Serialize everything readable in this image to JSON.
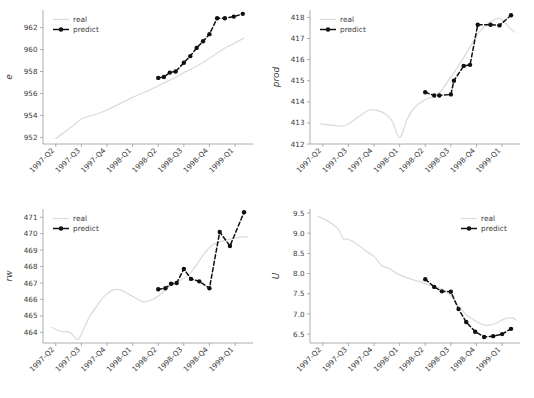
{
  "figure": {
    "background": "#ffffff",
    "layout": "2x2 grid of line charts",
    "panel_order": [
      "e",
      "prod",
      "rw",
      "U"
    ]
  },
  "style": {
    "real_color": "#dcdcdc",
    "predict_color": "#101010",
    "axis_color": "#9a9a9a",
    "text_color": "#3a3a3a"
  },
  "legend": {
    "real_label": "real",
    "predict_label": "predict"
  },
  "x_categories": [
    "1997-Q2",
    "1997-Q3",
    "1997-Q4",
    "1998-Q1",
    "1998-Q2",
    "1998-Q3",
    "1998-Q4",
    "1999-Q1"
  ],
  "chart_data": [
    {
      "type": "line",
      "title": "",
      "xlabel": "",
      "ylabel": "e",
      "grid": false,
      "legend_position": "upper left",
      "xlim": [
        0,
        8.2
      ],
      "ylim": [
        951.4,
        963.6
      ],
      "yticks": [
        952,
        954,
        956,
        958,
        960,
        962
      ],
      "xticks": [
        0.5,
        1.5,
        2.5,
        3.5,
        4.5,
        5.5,
        6.5,
        7.5
      ],
      "xticklabels": [
        "1997-Q2",
        "1997-Q3",
        "1997-Q4",
        "1998-Q1",
        "1998-Q2",
        "1998-Q3",
        "1998-Q4",
        "1999-Q1"
      ],
      "series": [
        {
          "name": "real",
          "x": [
            0.5,
            0.85,
            1.2,
            1.5,
            1.85,
            2.2,
            2.5,
            2.85,
            3.2,
            3.5,
            3.85,
            4.2,
            4.5,
            4.85,
            5.2,
            5.5,
            5.85,
            6.2,
            6.5,
            6.85,
            7.2,
            7.5,
            7.85
          ],
          "values": [
            951.9,
            952.5,
            953.1,
            953.7,
            953.95,
            954.2,
            954.5,
            954.9,
            955.3,
            955.65,
            956.0,
            956.35,
            956.7,
            957.1,
            957.5,
            957.9,
            958.3,
            958.75,
            959.2,
            959.75,
            960.25,
            960.6,
            961.05
          ]
        },
        {
          "name": "predict",
          "x": [
            4.5,
            4.72,
            4.95,
            5.18,
            5.5,
            5.75,
            6.0,
            6.25,
            6.5,
            6.8,
            7.1,
            7.45,
            7.8
          ],
          "values": [
            957.42,
            957.5,
            957.9,
            958.0,
            958.8,
            959.4,
            960.15,
            960.75,
            961.4,
            962.85,
            962.85,
            963.0,
            963.25
          ]
        }
      ]
    },
    {
      "type": "line",
      "title": "",
      "xlabel": "",
      "ylabel": "prod",
      "grid": false,
      "legend_position": "upper left",
      "xlim": [
        0,
        8.2
      ],
      "ylim": [
        412.0,
        418.35
      ],
      "yticks": [
        412,
        413,
        414,
        415,
        416,
        417,
        418
      ],
      "xticks": [
        0.5,
        1.5,
        2.5,
        3.5,
        4.5,
        5.5,
        6.5,
        7.5
      ],
      "xticklabels": [
        "1997-Q2",
        "1997-Q3",
        "1997-Q4",
        "1998-Q1",
        "1998-Q2",
        "1998-Q3",
        "1998-Q4",
        "1999-Q1"
      ],
      "series": [
        {
          "name": "real",
          "x": [
            0.4,
            0.8,
            1.2,
            1.5,
            1.9,
            2.3,
            2.6,
            2.9,
            3.2,
            3.5,
            3.8,
            4.1,
            4.5,
            4.8,
            5.1,
            5.4,
            5.8,
            6.2,
            6.6,
            7.0,
            7.4,
            7.8,
            8.0
          ],
          "values": [
            412.95,
            412.9,
            412.85,
            412.95,
            413.3,
            413.6,
            413.6,
            413.45,
            413.1,
            412.3,
            413.2,
            413.75,
            414.1,
            414.25,
            414.5,
            415.0,
            415.7,
            416.5,
            417.3,
            417.75,
            417.95,
            417.5,
            417.3
          ]
        },
        {
          "name": "predict",
          "x": [
            4.5,
            4.85,
            5.05,
            5.5,
            5.62,
            6.0,
            6.25,
            6.55,
            7.05,
            7.4,
            7.85
          ],
          "values": [
            414.45,
            414.3,
            414.3,
            414.35,
            415.0,
            415.7,
            415.75,
            417.65,
            417.65,
            417.62,
            418.1
          ]
        }
      ]
    },
    {
      "type": "line",
      "title": "",
      "xlabel": "",
      "ylabel": "rw",
      "grid": false,
      "legend_position": "upper left",
      "xlim": [
        0,
        8.2
      ],
      "ylim": [
        463.35,
        471.5
      ],
      "yticks": [
        464,
        465,
        466,
        467,
        468,
        469,
        470,
        471
      ],
      "xticks": [
        0.5,
        1.5,
        2.5,
        3.5,
        4.5,
        5.5,
        6.5,
        7.5
      ],
      "xticklabels": [
        "1997-Q2",
        "1997-Q3",
        "1997-Q4",
        "1998-Q1",
        "1998-Q2",
        "1998-Q3",
        "1998-Q4",
        "1999-Q1"
      ],
      "series": [
        {
          "name": "real",
          "x": [
            0.35,
            0.7,
            1.05,
            1.35,
            1.5,
            1.8,
            2.1,
            2.4,
            2.7,
            3.0,
            3.3,
            3.6,
            3.9,
            4.2,
            4.5,
            4.8,
            5.1,
            5.4,
            5.7,
            6.0,
            6.3,
            6.6,
            7.0,
            7.4,
            7.8,
            8.0
          ],
          "values": [
            464.3,
            464.05,
            464.0,
            463.55,
            463.9,
            464.9,
            465.6,
            466.2,
            466.55,
            466.6,
            466.35,
            466.1,
            465.85,
            465.95,
            466.2,
            466.6,
            466.9,
            467.2,
            467.5,
            468.1,
            468.8,
            469.3,
            469.55,
            469.7,
            469.8,
            469.8
          ]
        },
        {
          "name": "predict",
          "x": [
            4.5,
            4.78,
            5.0,
            5.22,
            5.5,
            5.78,
            6.1,
            6.5,
            6.9,
            7.3,
            7.85
          ],
          "values": [
            466.62,
            466.68,
            466.95,
            467.0,
            467.85,
            467.25,
            467.1,
            466.68,
            470.1,
            469.25,
            471.3
          ]
        }
      ]
    },
    {
      "type": "line",
      "title": "",
      "xlabel": "",
      "ylabel": "U",
      "grid": false,
      "legend_position": "upper right",
      "xlim": [
        0,
        8.2
      ],
      "ylim": [
        6.28,
        9.6
      ],
      "yticks": [
        6.5,
        7.0,
        7.5,
        8.0,
        8.5,
        9.0,
        9.5
      ],
      "yticklabels": [
        "6.5",
        "7.0",
        "7.5",
        "8.0",
        "8.5",
        "9.0",
        "9.5"
      ],
      "xticks": [
        0.5,
        1.5,
        2.5,
        3.5,
        4.5,
        5.5,
        6.5,
        7.5
      ],
      "xticklabels": [
        "1997-Q2",
        "1997-Q3",
        "1997-Q4",
        "1998-Q1",
        "1998-Q2",
        "1998-Q3",
        "1998-Q4",
        "1999-Q1"
      ],
      "series": [
        {
          "name": "real",
          "x": [
            0.3,
            0.7,
            1.1,
            1.3,
            1.5,
            1.9,
            2.2,
            2.5,
            2.8,
            3.1,
            3.4,
            3.7,
            4.0,
            4.3,
            4.6,
            4.9,
            5.2,
            5.5,
            5.8,
            6.1,
            6.4,
            6.7,
            7.0,
            7.3,
            7.6,
            7.9,
            8.05
          ],
          "values": [
            9.42,
            9.3,
            9.1,
            8.87,
            8.85,
            8.7,
            8.55,
            8.42,
            8.2,
            8.12,
            8.0,
            7.92,
            7.85,
            7.8,
            7.72,
            7.68,
            7.6,
            7.45,
            7.2,
            6.98,
            6.85,
            6.75,
            6.72,
            6.78,
            6.88,
            6.9,
            6.85
          ]
        },
        {
          "name": "predict",
          "x": [
            4.5,
            4.85,
            5.15,
            5.5,
            5.8,
            6.1,
            6.45,
            6.8,
            7.15,
            7.5,
            7.85
          ],
          "values": [
            7.86,
            7.67,
            7.56,
            7.55,
            7.12,
            6.8,
            6.56,
            6.43,
            6.45,
            6.5,
            6.63
          ]
        }
      ]
    }
  ]
}
